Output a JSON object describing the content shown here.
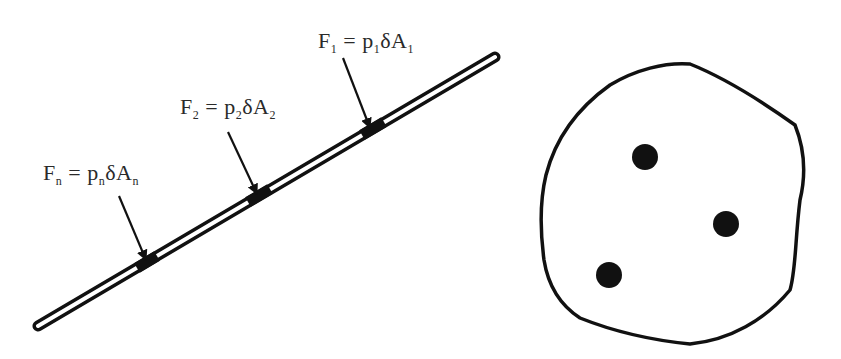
{
  "diagram": {
    "left_panel": {
      "description": "inclined plate with pressure forces",
      "forces": [
        {
          "id": "1",
          "F": "F",
          "eq": "=",
          "p": "p",
          "delta": "δA",
          "sub": "1",
          "label_x": 318,
          "label_y": 28,
          "tip": [
            370,
            130
          ],
          "tail": [
            343,
            58
          ]
        },
        {
          "id": "2",
          "F": "F",
          "eq": "=",
          "p": "p",
          "delta": "δA",
          "sub": "2",
          "label_x": 180,
          "label_y": 94,
          "tip": [
            258,
            196
          ],
          "tail": [
            228,
            132
          ]
        },
        {
          "id": "n",
          "F": "F",
          "eq": "=",
          "p": "p",
          "delta": "δA",
          "sub": "n",
          "label_x": 43,
          "label_y": 160,
          "tip": [
            147,
            262
          ],
          "tail": [
            119,
            196
          ]
        }
      ]
    },
    "right_panel": {
      "description": "irregular closed region with three point masses",
      "dots": [
        {
          "cx": 645,
          "cy": 157,
          "r": 13
        },
        {
          "cx": 726,
          "cy": 224,
          "r": 13
        },
        {
          "cx": 609,
          "cy": 275,
          "r": 13
        }
      ]
    },
    "colors": {
      "ink": "#111111",
      "text": "#2a2a2a",
      "background": "#ffffff"
    }
  }
}
